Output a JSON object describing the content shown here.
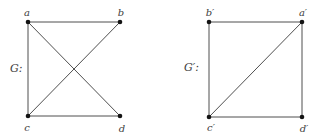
{
  "figure": {
    "width": 318,
    "height": 137,
    "background": "#ffffff"
  },
  "style": {
    "edge_color": "#4f4f4f",
    "edge_width": 1,
    "vertex_color": "#141414",
    "vertex_radius": 2.3,
    "label_color": "#3d3d3d",
    "label_font_size": 10,
    "name_font_size": 11
  },
  "graphs": [
    {
      "id": "G",
      "name_label": "G:",
      "name_x": 10,
      "name_y": 72,
      "vertices": [
        {
          "id": "a",
          "label": "a",
          "x": 28,
          "y": 22,
          "label_x": 27,
          "label_y": 16
        },
        {
          "id": "b",
          "label": "b",
          "x": 120,
          "y": 22,
          "label_x": 121,
          "label_y": 16
        },
        {
          "id": "c",
          "label": "c",
          "x": 28,
          "y": 116,
          "label_x": 27,
          "label_y": 131
        },
        {
          "id": "d",
          "label": "d",
          "x": 120,
          "y": 116,
          "label_x": 122,
          "label_y": 132
        }
      ],
      "edges": [
        [
          "a",
          "b"
        ],
        [
          "a",
          "c"
        ],
        [
          "a",
          "d"
        ],
        [
          "b",
          "c"
        ],
        [
          "c",
          "d"
        ]
      ]
    },
    {
      "id": "G-prime",
      "name_label": "G′:",
      "name_x": 184,
      "name_y": 71,
      "vertices": [
        {
          "id": "b-prime",
          "label": "b′",
          "x": 209,
          "y": 22,
          "label_x": 210,
          "label_y": 16
        },
        {
          "id": "a-prime",
          "label": "a′",
          "x": 302,
          "y": 22,
          "label_x": 303,
          "label_y": 16
        },
        {
          "id": "c-prime",
          "label": "c′",
          "x": 209,
          "y": 117,
          "label_x": 211,
          "label_y": 131
        },
        {
          "id": "d-prime",
          "label": "d′",
          "x": 302,
          "y": 117,
          "label_x": 304,
          "label_y": 132
        }
      ],
      "edges": [
        [
          "b-prime",
          "a-prime"
        ],
        [
          "b-prime",
          "c-prime"
        ],
        [
          "a-prime",
          "d-prime"
        ],
        [
          "c-prime",
          "d-prime"
        ],
        [
          "c-prime",
          "a-prime"
        ]
      ]
    }
  ]
}
